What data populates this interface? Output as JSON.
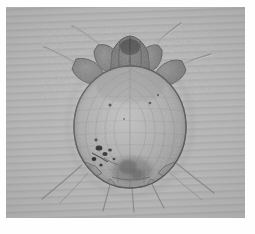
{
  "image": {
    "kind": "light-microscopy-photomicrograph",
    "subject_label": "mite",
    "view": "dorsal whole-mount",
    "caption": "",
    "plate": {
      "background_color": "#b4b4b4",
      "border_color": "#fefefe",
      "width_px": 239,
      "height_px": 211
    }
  },
  "specimen": {
    "name": "sarcoptes-scabiei-mite",
    "body": {
      "label": "idiosoma",
      "shape": "oval",
      "center_x": 124,
      "center_y": 120,
      "radius_x": 56,
      "radius_y": 61,
      "outline_color": "#5a5a5a",
      "fill_color": "#a9a9a9"
    },
    "gnathosoma": {
      "label": "gnathosoma-mouthparts",
      "center_x": 124,
      "center_y": 43,
      "fill_color": "#6f6f6f"
    },
    "legs": [
      {
        "name": "leg-1-left",
        "side": "left",
        "pair": 1,
        "has_terminal_seta": true
      },
      {
        "name": "leg-1-right",
        "side": "right",
        "pair": 1,
        "has_terminal_seta": true
      },
      {
        "name": "leg-2-left",
        "side": "left",
        "pair": 2,
        "has_terminal_seta": true
      },
      {
        "name": "leg-2-right",
        "side": "right",
        "pair": 2,
        "has_terminal_seta": true
      },
      {
        "name": "leg-3-left",
        "side": "left",
        "pair": 3,
        "has_terminal_seta": true
      },
      {
        "name": "leg-3-right",
        "side": "right",
        "pair": 3,
        "has_terminal_seta": true
      },
      {
        "name": "leg-4-left",
        "side": "left",
        "pair": 4,
        "has_terminal_seta": true
      },
      {
        "name": "leg-4-right",
        "side": "right",
        "pair": 4,
        "has_terminal_seta": true
      }
    ],
    "features": [
      {
        "name": "dorsal-striations",
        "color": "#777777"
      },
      {
        "name": "dark-pigment-spots",
        "color": "#2b2b2b",
        "region": "left-posterior"
      },
      {
        "name": "anal-region-shading",
        "color": "#6a6a6a",
        "region": "posterior-median"
      },
      {
        "name": "posterior-setae",
        "color": "#6d6d6d",
        "count": 4
      }
    ]
  },
  "colors": {
    "plate_gray": "#b4b4b4",
    "body_fill": "#a9a9a9",
    "outline": "#5a5a5a",
    "dark_spot": "#2b2b2b",
    "paper_white": "#fefefe"
  }
}
